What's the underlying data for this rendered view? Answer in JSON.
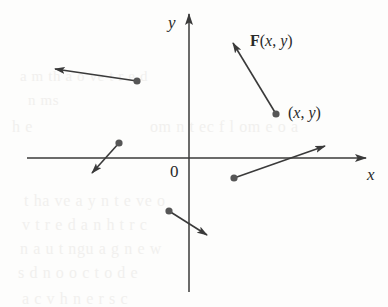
{
  "figure": {
    "background_color": "#fdfdfc",
    "stroke_color": "#3a3a3a",
    "dot_color": "#565656",
    "label_color": "#2a2a2a",
    "width": 388,
    "height": 307
  },
  "axes": {
    "x_label": "x",
    "y_label": "y",
    "origin_label": "0",
    "x_axis": {
      "x1": 27,
      "y1": 158,
      "x2": 366,
      "y2": 158
    },
    "y_axis": {
      "x1": 189,
      "y1": 14,
      "x2": 189,
      "y2": 292
    },
    "origin": {
      "x": 189,
      "y": 158
    }
  },
  "labels": {
    "vector_field": {
      "bold": "F",
      "open": "(",
      "x": "x",
      "comma": ", ",
      "y": "y",
      "close": ")"
    },
    "point": {
      "open": "(",
      "x": "x",
      "comma": ", ",
      "y": "y",
      "close": ")"
    }
  },
  "chart_data": {
    "type": "scatter",
    "xlabel": "x",
    "ylabel": "y",
    "grid": false,
    "legend": null,
    "annotations": [
      "F(x, y)",
      "(x, y)",
      "0",
      "x",
      "y"
    ],
    "vectors": [
      {
        "name": "upper-left-vector",
        "tail": {
          "x": 137,
          "y": 81
        },
        "tip": {
          "x": 55,
          "y": 69
        }
      },
      {
        "name": "left-middle-vector",
        "tail": {
          "x": 119,
          "y": 143
        },
        "tip": {
          "x": 92,
          "y": 173
        }
      },
      {
        "name": "lower-middle-vector",
        "tail": {
          "x": 169,
          "y": 211
        },
        "tip": {
          "x": 207,
          "y": 235
        }
      },
      {
        "name": "right-lower-vector",
        "tail": {
          "x": 234,
          "y": 178
        },
        "tip": {
          "x": 325,
          "y": 146
        }
      },
      {
        "name": "labeled-vector-F",
        "tail": {
          "x": 276,
          "y": 114
        },
        "tip": {
          "x": 233,
          "y": 43
        }
      }
    ]
  },
  "bleed_text": [
    {
      "text": "a   m  th  a  o ve  t  r   e d",
      "x": 20,
      "y": 68,
      "size": 15
    },
    {
      "text": "n  ms",
      "x": 28,
      "y": 92,
      "size": 15
    },
    {
      "text": "h e",
      "x": 12,
      "y": 118,
      "size": 16
    },
    {
      "text": "om   n t  ec  f  l  om  e o  a",
      "x": 150,
      "y": 118,
      "size": 16
    },
    {
      "text": "t   ha  ve  a   y n  t e  ve o",
      "x": 24,
      "y": 192,
      "size": 16
    },
    {
      "text": "v  t  r   e d  a   n  h  t  r c",
      "x": 22,
      "y": 216,
      "size": 16
    },
    {
      "text": "n   a  u   t  ngu a   g    n e  w",
      "x": 20,
      "y": 240,
      "size": 16
    },
    {
      "text": "s  d  n   o   o  c   t  o d  e",
      "x": 18,
      "y": 264,
      "size": 16
    },
    {
      "text": "a   c   v  h  n  e   r   s   c",
      "x": 22,
      "y": 290,
      "size": 16
    }
  ]
}
